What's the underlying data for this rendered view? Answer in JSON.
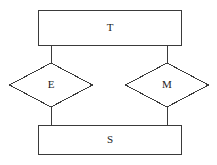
{
  "diagram": {
    "type": "entity-relationship-diagram",
    "canvas": {
      "width": 217,
      "height": 165,
      "background": "#ffffff"
    },
    "style": {
      "stroke_color": "#3a3a3a",
      "fill_color": "#ffffff",
      "stroke_width": 1,
      "label_color": "#1a1a1a"
    },
    "entities": [
      {
        "id": "entity-t",
        "label": "T",
        "shape": "rectangle",
        "x": 38,
        "y": 10,
        "width": 144,
        "height": 36,
        "label_x": 110,
        "label_y": 28
      },
      {
        "id": "entity-s",
        "label": "S",
        "shape": "rectangle",
        "x": 38,
        "y": 125,
        "width": 144,
        "height": 30,
        "label_x": 110,
        "label_y": 140
      }
    ],
    "relationships": [
      {
        "id": "relationship-e",
        "label": "E",
        "shape": "diamond",
        "center_x": 51,
        "center_y": 85,
        "half_width": 42,
        "half_height": 22,
        "points": "51,63 93,85 51,107 9,85"
      },
      {
        "id": "relationship-m",
        "label": "M",
        "shape": "diamond",
        "center_x": 167,
        "center_y": 85,
        "half_width": 42,
        "half_height": 22,
        "points": "167,63 209,85 167,107 125,85"
      }
    ],
    "connectors": [
      {
        "id": "connector-t-e",
        "from": "entity-t",
        "to": "relationship-e",
        "x1": 51,
        "y1": 46,
        "x2": 51,
        "y2": 63
      },
      {
        "id": "connector-e-s",
        "from": "relationship-e",
        "to": "entity-s",
        "x1": 51,
        "y1": 107,
        "x2": 51,
        "y2": 125
      },
      {
        "id": "connector-t-m",
        "from": "entity-t",
        "to": "relationship-m",
        "x1": 167,
        "y1": 46,
        "x2": 167,
        "y2": 63
      },
      {
        "id": "connector-m-s",
        "from": "relationship-m",
        "to": "entity-s",
        "x1": 167,
        "y1": 107,
        "x2": 167,
        "y2": 125
      }
    ]
  }
}
